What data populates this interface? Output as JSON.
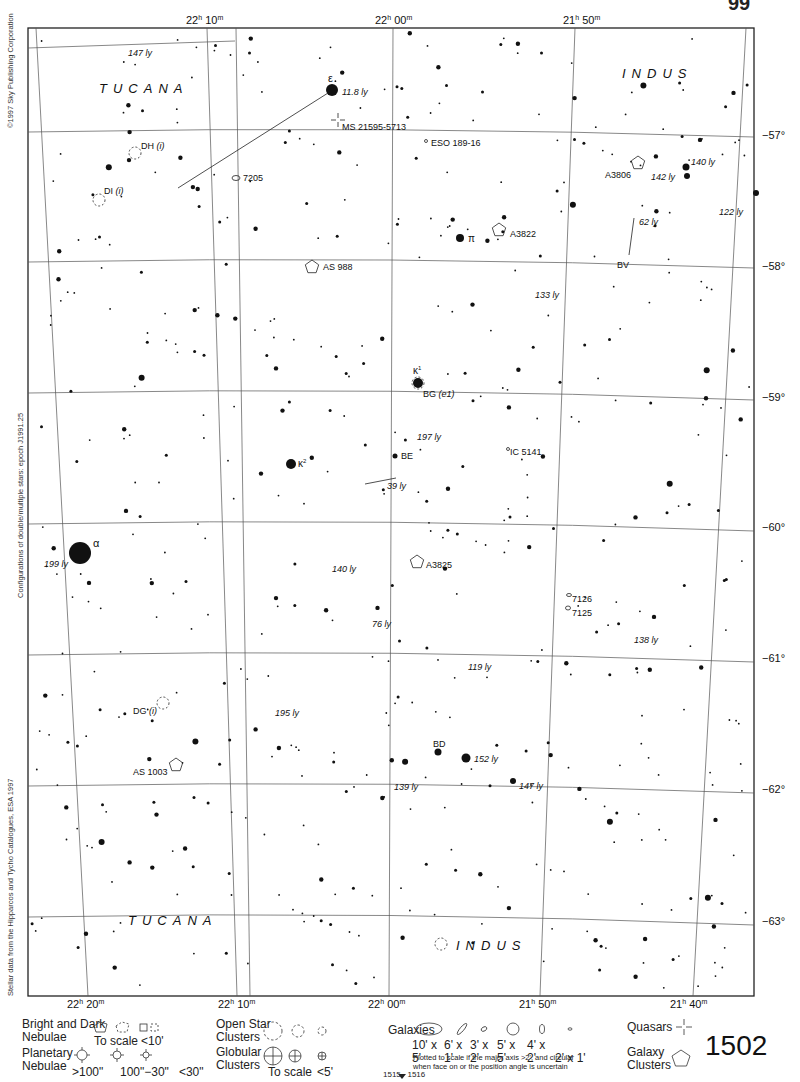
{
  "page": {
    "page_number": "1502",
    "adjacent_pages": [
      "1515",
      "1516"
    ],
    "corner_mark": "99",
    "side_notes": {
      "copyright": "©1997 Sky Publishing Corporation",
      "configurations": "Configurations of double/multiple stars: epoch J1991.25",
      "stellar_data": "Stellar data from the Hipparcos and Tycho Catalogues, ESA 1997"
    }
  },
  "axes": {
    "ra_top": [
      {
        "h": "22",
        "m": "10"
      },
      {
        "h": "22",
        "m": "00"
      },
      {
        "h": "21",
        "m": "50"
      }
    ],
    "ra_bottom": [
      {
        "h": "22",
        "m": "20"
      },
      {
        "h": "22",
        "m": "10"
      },
      {
        "h": "22",
        "m": "00"
      },
      {
        "h": "21",
        "m": "50"
      },
      {
        "h": "21",
        "m": "40"
      }
    ],
    "dec": [
      "−57°",
      "−58°",
      "−59°",
      "−60°",
      "−61°",
      "−62°",
      "−63°"
    ]
  },
  "constellations": [
    {
      "name": "TUCANA",
      "pos": "top-left"
    },
    {
      "name": "INDUS",
      "pos": "top-right"
    },
    {
      "name": "TUCANA",
      "pos": "bottom-left"
    },
    {
      "name": "INDUS",
      "pos": "bottom-center"
    }
  ],
  "labels": {
    "stars": [
      {
        "text": "ε",
        "dist": "11.8 ly"
      },
      {
        "text": "π",
        "dist": ""
      },
      {
        "text": "κ1",
        "dist": ""
      },
      {
        "text": "κ2",
        "dist": ""
      },
      {
        "text": "α",
        "dist": "199 ly"
      },
      {
        "text": "BD",
        "dist": ""
      },
      {
        "text": "BE",
        "dist": ""
      },
      {
        "text": "BV",
        "dist": ""
      }
    ],
    "distances": [
      "147 ly",
      "140 ly",
      "142 ly",
      "122 ly",
      "62 ly",
      "133 ly",
      "197 ly",
      "39 ly",
      "140 ly",
      "76 ly",
      "138 ly",
      "119 ly",
      "195 ly",
      "152 ly",
      "139 ly",
      "147 ly"
    ],
    "objects": [
      {
        "id": "ms",
        "text": "MS 21595-5713",
        "type": "quasar"
      },
      {
        "id": "eso",
        "text": "ESO 189-16",
        "type": "galaxy"
      },
      {
        "id": "dh",
        "text": "DH",
        "suffix": "(i)",
        "type": "star-dh"
      },
      {
        "id": "di",
        "text": "DI",
        "suffix": "(i)",
        "type": "star-di"
      },
      {
        "id": "n7205",
        "text": "7205",
        "type": "galaxy"
      },
      {
        "id": "a3806",
        "text": "A3806",
        "type": "galaxy-cluster"
      },
      {
        "id": "a3822",
        "text": "A3822",
        "type": "galaxy-cluster"
      },
      {
        "id": "as988",
        "text": "AS 988",
        "type": "galaxy-cluster"
      },
      {
        "id": "bg",
        "text": "BG",
        "suffix": "(e1)",
        "type": "star-bg"
      },
      {
        "id": "ic5141",
        "text": "IC 5141",
        "type": "galaxy"
      },
      {
        "id": "a3825",
        "text": "A3825",
        "type": "galaxy-cluster"
      },
      {
        "id": "n7126",
        "text": "7126",
        "type": "galaxy"
      },
      {
        "id": "n7125",
        "text": "7125",
        "type": "galaxy"
      },
      {
        "id": "dg",
        "text": "DG",
        "suffix": "(i)",
        "type": "star-dg"
      },
      {
        "id": "as1003",
        "text": "AS 1003",
        "type": "galaxy-cluster"
      }
    ]
  },
  "legend": {
    "nebulae": {
      "title_1": "Bright and Dark",
      "title_2": "Nebulae",
      "to_scale": "To scale",
      "small": "<10'"
    },
    "planetary": {
      "title_1": "Planetary",
      "title_2": "Nebulae",
      "sizes": [
        ">100\"",
        "100\"−30\"",
        "<30\""
      ]
    },
    "open_clusters": {
      "title_1": "Open Star",
      "title_2": "Clusters"
    },
    "globular": {
      "title_1": "Globular",
      "title_2": "Clusters",
      "to_scale": "To scale",
      "small": "<5'"
    },
    "galaxies": {
      "title": "Galaxies",
      "sizes": [
        "10' x 5'",
        "6' x 1'",
        "3' x 2'",
        "5' x 5'",
        "4' x 2'",
        "2' x 1'"
      ],
      "note_1": "Plotted to scale if the major axis >2', and circular",
      "note_2": "when face on or the position angle is uncertain"
    },
    "quasars": {
      "title": "Quasars"
    },
    "galaxy_clusters": {
      "title_1": "Galaxy",
      "title_2": "Clusters"
    }
  }
}
